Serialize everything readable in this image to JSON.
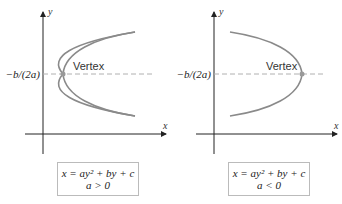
{
  "diagram": {
    "panels": [
      {
        "id": "left",
        "x_axis_label": "x",
        "y_axis_label": "y",
        "y_tick_label": "−b/(2a)",
        "vertex_label": "Vertex",
        "opens": "right",
        "equation": "x = ay² + by + c",
        "condition": "a > 0"
      },
      {
        "id": "right",
        "x_axis_label": "x",
        "y_axis_label": "y",
        "y_tick_label": "−b/(2a)",
        "vertex_label": "Vertex",
        "opens": "left",
        "equation": "x = ay² + by + c",
        "condition": "a < 0"
      }
    ],
    "colors": {
      "axis": "#222222",
      "curve": "#8a8a8a",
      "dashed": "#b0b0b0",
      "vertex_dot": "#999999",
      "box_border": "#bbbbbb"
    }
  }
}
